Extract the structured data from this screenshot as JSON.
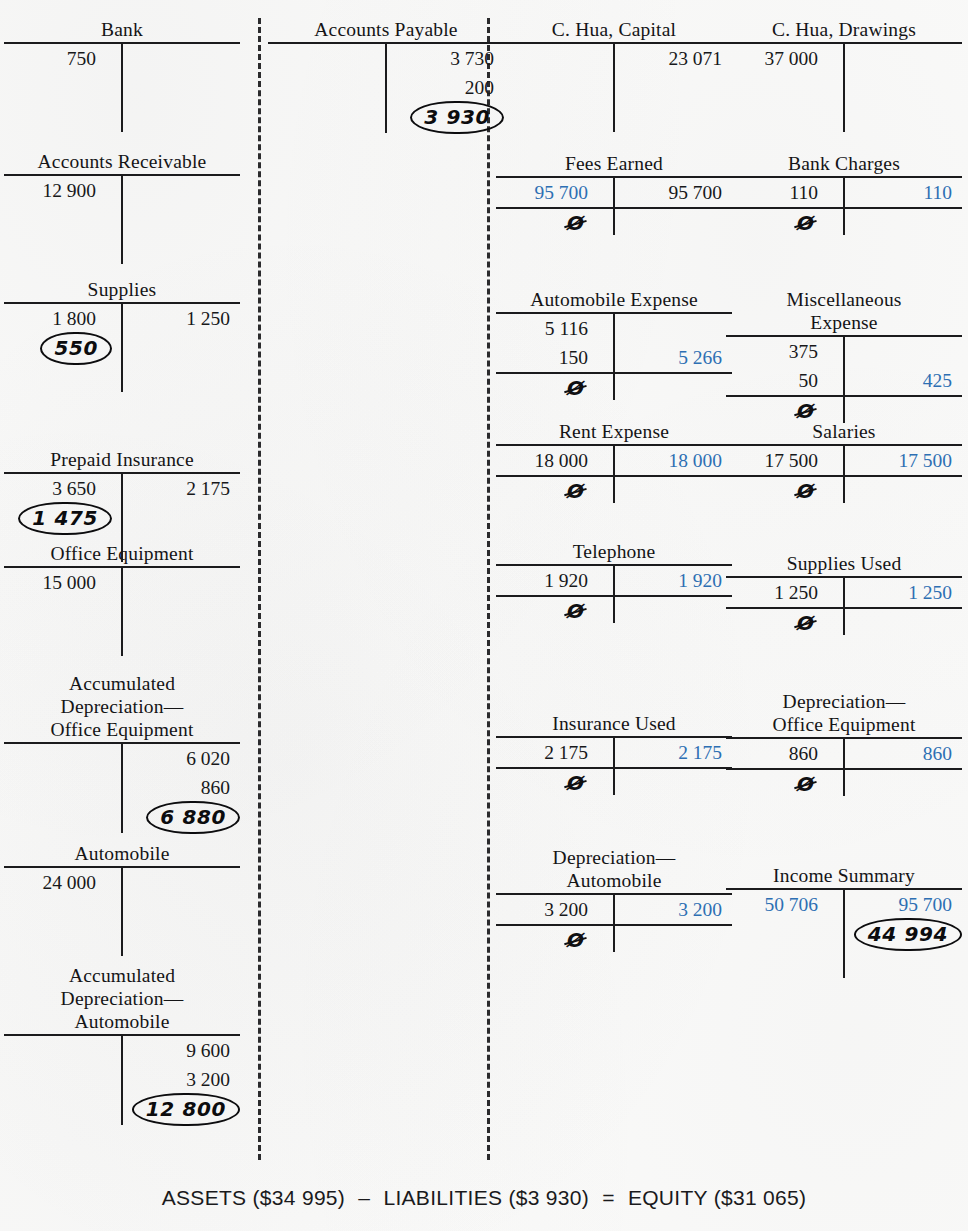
{
  "document": {
    "kind": "t-account-ledger-worksheet",
    "nil_symbol": "Ø",
    "colors": {
      "ink": "#17181a",
      "closing_entry_blue": "#2d6fb3",
      "handwriting": "#0c0c0e",
      "paper": "#fbfbfa"
    }
  },
  "columns": [
    {
      "id": "assets",
      "accounts": [
        {
          "name": "Bank",
          "title": "Bank",
          "rows": [
            {
              "debit": "750",
              "credit": ""
            }
          ],
          "closed": false,
          "balance": null
        },
        {
          "name": "Accounts Receivable",
          "title": "Accounts Receivable",
          "rows": [
            {
              "debit": "12 900",
              "credit": ""
            }
          ],
          "closed": false,
          "balance": null
        },
        {
          "name": "Supplies",
          "title": "Supplies",
          "rows": [
            {
              "debit": "1 800",
              "credit": "1 250"
            }
          ],
          "closed": false,
          "balance": {
            "value": "550",
            "side": "debit"
          }
        },
        {
          "name": "Prepaid Insurance",
          "title": "Prepaid Insurance",
          "rows": [
            {
              "debit": "3 650",
              "credit": "2 175"
            }
          ],
          "closed": false,
          "balance": {
            "value": "1 475",
            "side": "debit"
          }
        },
        {
          "name": "Office Equipment",
          "title": "Office Equipment",
          "rows": [
            {
              "debit": "15 000",
              "credit": ""
            }
          ],
          "closed": false,
          "balance": null
        },
        {
          "name": "Accumulated Depreciation Office Equipment",
          "title": "Accumulated\nDepreciation—\nOffice Equipment",
          "rows": [
            {
              "debit": "",
              "credit": "6 020"
            },
            {
              "debit": "",
              "credit": "860"
            }
          ],
          "closed": false,
          "balance": {
            "value": "6 880",
            "side": "credit"
          }
        },
        {
          "name": "Automobile",
          "title": "Automobile",
          "rows": [
            {
              "debit": "24 000",
              "credit": ""
            }
          ],
          "closed": false,
          "balance": null
        },
        {
          "name": "Accumulated Depreciation Automobile",
          "title": "Accumulated\nDepreciation—\nAutomobile",
          "rows": [
            {
              "debit": "",
              "credit": "9 600"
            },
            {
              "debit": "",
              "credit": "3 200"
            }
          ],
          "closed": false,
          "balance": {
            "value": "12 800",
            "side": "credit"
          }
        }
      ]
    },
    {
      "id": "liabilities",
      "accounts": [
        {
          "name": "Accounts Payable",
          "title": "Accounts Payable",
          "rows": [
            {
              "debit": "",
              "credit": "3 730"
            },
            {
              "debit": "",
              "credit": "200"
            }
          ],
          "closed": false,
          "balance": {
            "value": "3 930",
            "side": "credit"
          }
        }
      ]
    },
    {
      "id": "equity-and-expenses-left",
      "accounts": [
        {
          "name": "C. Hua, Capital",
          "title": "C. Hua, Capital",
          "rows": [
            {
              "debit": "",
              "credit": "23 071"
            }
          ],
          "closed": false,
          "balance": null
        },
        {
          "name": "Fees Earned",
          "title": "Fees Earned",
          "rows": [
            {
              "debit": "95 700",
              "debit_closing": true,
              "credit": "95 700"
            }
          ],
          "closed": true,
          "balance": null
        },
        {
          "name": "Automobile Expense",
          "title": "Automobile Expense",
          "rows": [
            {
              "debit": "5 116",
              "credit": ""
            },
            {
              "debit": "150",
              "credit": "5 266",
              "credit_closing": true
            }
          ],
          "closed": true,
          "balance": null
        },
        {
          "name": "Rent Expense",
          "title": "Rent Expense",
          "rows": [
            {
              "debit": "18 000",
              "credit": "18 000",
              "credit_closing": true
            }
          ],
          "closed": true,
          "balance": null
        },
        {
          "name": "Telephone",
          "title": "Telephone",
          "rows": [
            {
              "debit": "1 920",
              "credit": "1 920",
              "credit_closing": true
            }
          ],
          "closed": true,
          "balance": null
        },
        {
          "name": "Insurance Used",
          "title": "Insurance Used",
          "rows": [
            {
              "debit": "2 175",
              "credit": "2 175",
              "credit_closing": true
            }
          ],
          "closed": true,
          "balance": null
        },
        {
          "name": "Depreciation Automobile",
          "title": "Depreciation—\nAutomobile",
          "rows": [
            {
              "debit": "3 200",
              "credit": "3 200",
              "credit_closing": true
            }
          ],
          "closed": true,
          "balance": null
        }
      ]
    },
    {
      "id": "drawings-and-expenses-right",
      "accounts": [
        {
          "name": "C. Hua, Drawings",
          "title": "C. Hua, Drawings",
          "rows": [
            {
              "debit": "37 000",
              "credit": ""
            }
          ],
          "closed": false,
          "balance": null
        },
        {
          "name": "Bank Charges",
          "title": "Bank Charges",
          "rows": [
            {
              "debit": "110",
              "credit": "110",
              "credit_closing": true
            }
          ],
          "closed": true,
          "balance": null
        },
        {
          "name": "Miscellaneous Expense",
          "title": "Miscellaneous\nExpense",
          "rows": [
            {
              "debit": "375",
              "credit": ""
            },
            {
              "debit": "50",
              "credit": "425",
              "credit_closing": true
            }
          ],
          "closed": true,
          "balance": null
        },
        {
          "name": "Salaries",
          "title": "Salaries",
          "rows": [
            {
              "debit": "17 500",
              "credit": "17 500",
              "credit_closing": true
            }
          ],
          "closed": true,
          "balance": null
        },
        {
          "name": "Supplies Used",
          "title": "Supplies Used",
          "rows": [
            {
              "debit": "1 250",
              "credit": "1 250",
              "credit_closing": true
            }
          ],
          "closed": true,
          "balance": null
        },
        {
          "name": "Depreciation Office Equipment",
          "title": "Depreciation—\nOffice Equipment",
          "rows": [
            {
              "debit": "860",
              "credit": "860",
              "credit_closing": true
            }
          ],
          "closed": true,
          "balance": null
        },
        {
          "name": "Income Summary",
          "title": "Income Summary",
          "rows": [
            {
              "debit": "50 706",
              "debit_closing": true,
              "credit": "95 700",
              "credit_closing": true
            }
          ],
          "closed": false,
          "balance": {
            "value": "44 994",
            "side": "credit"
          }
        }
      ]
    }
  ],
  "equation": {
    "assets_label": "ASSETS",
    "assets_value": "($34 995)",
    "minus": "–",
    "liabilities_label": "LIABILITIES",
    "liabilities_value": "($3 930)",
    "equals": "=",
    "equity_label": "EQUITY",
    "equity_value": "($31 065)"
  },
  "layout": {
    "column_x": [
      4,
      268,
      496,
      726
    ],
    "account_tops": {
      "assets": [
        18,
        150,
        278,
        448,
        542,
        672,
        842,
        964
      ],
      "liabilities": [
        18
      ],
      "equity-and-expenses-left": [
        18,
        152,
        288,
        420,
        540,
        712,
        846
      ],
      "drawings-and-expenses-right": [
        18,
        152,
        288,
        420,
        552,
        690,
        864
      ]
    },
    "divider_x": [
      258,
      487
    ]
  }
}
